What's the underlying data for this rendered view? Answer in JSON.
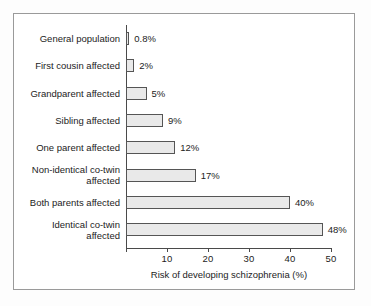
{
  "chart_data": {
    "type": "bar",
    "orientation": "horizontal",
    "title": "",
    "xlabel": "Risk of developing schizophrenia (%)",
    "ylabel": "",
    "xlim": [
      0,
      50
    ],
    "xticks": [
      0,
      10,
      20,
      30,
      40,
      50
    ],
    "xtick_labels": [
      "",
      "10",
      "20",
      "30",
      "40",
      "50"
    ],
    "grid": false,
    "legend": null,
    "bar_fill_color": "#e9e9e9",
    "bar_edge_color": "#555555",
    "categories": [
      "General population",
      "First cousin affected",
      "Grandparent affected",
      "Sibling affected",
      "One parent affected",
      "Non-identical co-twin affected",
      "Both parents affected",
      "Identical co-twin affected"
    ],
    "values": [
      0.8,
      2,
      5,
      9,
      12,
      17,
      40,
      48
    ],
    "value_labels": [
      "0.8%",
      "2%",
      "5%",
      "9%",
      "12%",
      "17%",
      "40%",
      "48%"
    ]
  },
  "bars": [
    {
      "label": "General population",
      "label_lines": [
        "General population"
      ],
      "value": 0.8,
      "value_label": "0.8%"
    },
    {
      "label": "First cousin affected",
      "label_lines": [
        "First cousin affected"
      ],
      "value": 2,
      "value_label": "2%"
    },
    {
      "label": "Grandparent affected",
      "label_lines": [
        "Grandparent affected"
      ],
      "value": 5,
      "value_label": "5%"
    },
    {
      "label": "Sibling affected",
      "label_lines": [
        "Sibling affected"
      ],
      "value": 9,
      "value_label": "9%"
    },
    {
      "label": "One parent affected",
      "label_lines": [
        "One parent affected"
      ],
      "value": 12,
      "value_label": "12%"
    },
    {
      "label": "Non-identical co-twin affected",
      "label_lines": [
        "Non-identical co-twin",
        "affected"
      ],
      "value": 17,
      "value_label": "17%"
    },
    {
      "label": "Both parents affected",
      "label_lines": [
        "Both parents affected"
      ],
      "value": 40,
      "value_label": "40%"
    },
    {
      "label": "Identical co-twin affected",
      "label_lines": [
        "Identical co-twin",
        "affected"
      ],
      "value": 48,
      "value_label": "48%"
    }
  ],
  "axis": {
    "title": "Risk of developing schizophrenia (%)",
    "ticks": [
      {
        "value": 0,
        "label": ""
      },
      {
        "value": 10,
        "label": "10"
      },
      {
        "value": 20,
        "label": "20"
      },
      {
        "value": 30,
        "label": "30"
      },
      {
        "value": 40,
        "label": "40"
      },
      {
        "value": 50,
        "label": "50"
      }
    ]
  }
}
